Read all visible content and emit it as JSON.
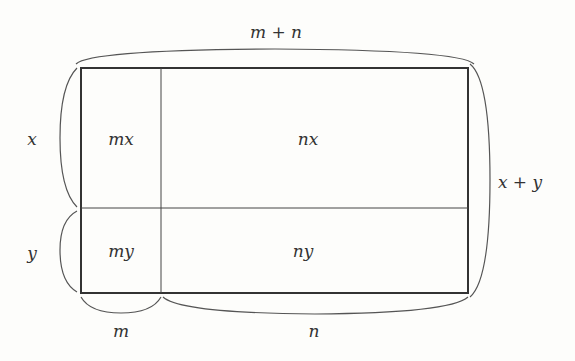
{
  "diagram": {
    "top_label": "m + n",
    "right_label": "x + y",
    "left_labels": [
      "x",
      "y"
    ],
    "bottom_labels": [
      "m",
      "n"
    ],
    "cells": [
      {
        "id": "mx",
        "label": "mx"
      },
      {
        "id": "nx",
        "label": "nx"
      },
      {
        "id": "my",
        "label": "my"
      },
      {
        "id": "ny",
        "label": "ny"
      }
    ],
    "colors": {
      "line": "#333333",
      "brace": "#555555",
      "background": "#fdfdfb"
    }
  }
}
